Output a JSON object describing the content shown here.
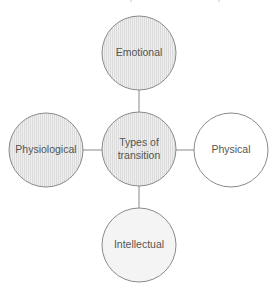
{
  "diagram": {
    "type": "hub-and-spoke",
    "center": {
      "id": "center",
      "label_lines": [
        "Types of",
        "transition"
      ],
      "style": "hatched"
    },
    "nodes": [
      {
        "id": "top",
        "label": "Emotional",
        "style": "hatched"
      },
      {
        "id": "left",
        "label": "Physiological",
        "style": "hatched"
      },
      {
        "id": "right",
        "label": "Physical",
        "style": "plain"
      },
      {
        "id": "bottom",
        "label": "Intellectual",
        "style": "light"
      }
    ],
    "colors": {
      "stroke": "#8a8a8a",
      "hatched_fill": "#efefef",
      "hatch_line": "#d6d6d6",
      "light_fill": "#f4f4f4",
      "plain_fill": "#ffffff",
      "text": "#555555"
    }
  }
}
